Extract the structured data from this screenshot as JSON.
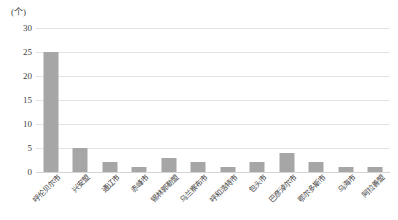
{
  "chart_data": {
    "type": "bar",
    "title": "",
    "subtitle": "",
    "xlabel": "",
    "ylabel": "",
    "unit_label": "(个)",
    "ylim": [
      0,
      30
    ],
    "yticks": [
      0,
      5,
      10,
      15,
      20,
      25,
      30
    ],
    "grid": true,
    "legend": false,
    "legend_position": "none",
    "bar_color": "#a6a6a6",
    "gridline_color": "#e3e3e3",
    "axis_color": "#d4d4d4",
    "text_color": "#3f3f3f",
    "categories": [
      "呼伦贝尔市",
      "兴安盟",
      "通辽市",
      "赤峰市",
      "锡林郭勒盟",
      "乌兰察布市",
      "呼和浩特市",
      "包头市",
      "巴彦淖尔市",
      "鄂尔多斯市",
      "乌海市",
      "阿拉善盟"
    ],
    "values": [
      25,
      5,
      2,
      1,
      3,
      2,
      1,
      2,
      4,
      2,
      1,
      1
    ]
  }
}
